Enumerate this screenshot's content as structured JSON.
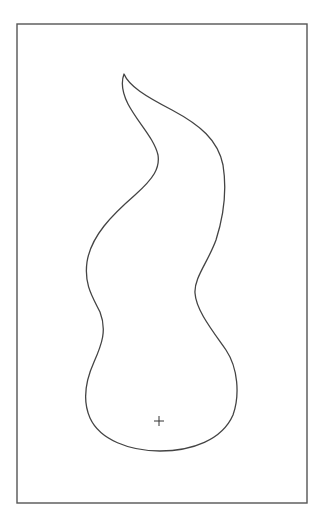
{
  "diagram": {
    "type": "outline-shape",
    "description": "Flame / teardrop-like closed curved outline inside a rectangular frame, with a centroid cross marker near the bottom",
    "colors": {
      "background": "#ffffff",
      "frame_stroke": "#555555",
      "shape_stroke": "#444444",
      "marker_stroke": "#333333"
    },
    "frame": {
      "x": 17,
      "y": 24,
      "width": 290,
      "height": 479
    },
    "shape": {
      "tip": {
        "x": 124,
        "y": 74
      },
      "bottom": {
        "x": 160,
        "y": 451
      }
    },
    "marker": {
      "symbol": "+",
      "x": 159,
      "y": 421,
      "size": 5
    }
  }
}
